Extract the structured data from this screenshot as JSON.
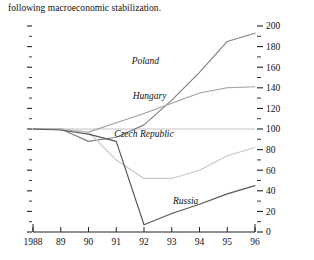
{
  "caption": {
    "text": "following macroeconomic stabilization."
  },
  "chart_data": {
    "type": "line",
    "title": "",
    "subtitle": "",
    "xlabel": "",
    "ylabel": "",
    "x": [
      1988,
      1989,
      1990,
      1991,
      1992,
      1993,
      1994,
      1995,
      1996
    ],
    "xtick_labels": [
      "1988",
      "89",
      "90",
      "91",
      "92",
      "93",
      "94",
      "95",
      "96"
    ],
    "ytick_labels": [
      "0",
      "20",
      "40",
      "60",
      "80",
      "100",
      "120",
      "140",
      "160",
      "180",
      "200"
    ],
    "ytick_values": [
      0,
      20,
      40,
      60,
      80,
      100,
      120,
      140,
      160,
      180,
      200
    ],
    "ylim": [
      0,
      200
    ],
    "xlim": [
      1988,
      1996
    ],
    "minor_tick_step": 10,
    "y_axis_position": "right",
    "left_axis_ticks_only": true,
    "grid": false,
    "reference_line": 100,
    "legend": "inline-labels",
    "series": [
      {
        "name": "Poland",
        "color": "#808080",
        "label_x": 1992.05,
        "label_y": 163,
        "values": [
          100,
          100,
          88,
          92,
          104,
          128,
          155,
          185,
          193
        ]
      },
      {
        "name": "Hungary",
        "color": "#a0a0a0",
        "label_x": 1992.2,
        "label_y": 129,
        "values": [
          100,
          100,
          97,
          106,
          115,
          125,
          135,
          140,
          141
        ]
      },
      {
        "name": "Czech Republic",
        "color": "#c8c8c8",
        "label_x": 1992.0,
        "label_y": 92,
        "values": [
          100,
          100,
          97,
          70,
          52,
          52,
          60,
          74,
          82
        ]
      },
      {
        "name": "Russia",
        "color": "#555555",
        "label_x": 1993.5,
        "label_y": 27,
        "values": [
          100,
          99,
          95,
          88,
          7,
          18,
          27,
          37,
          45
        ]
      }
    ]
  }
}
